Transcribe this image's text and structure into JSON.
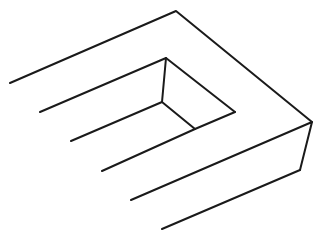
{
  "figure": {
    "title": "",
    "width": 333,
    "height": 243,
    "stroke_color": "#1a1a1a",
    "background": "#ffffff",
    "paths": [
      {
        "name": "outer-top-edge",
        "points": [
          [
            10,
            83
          ],
          [
            176,
            11
          ],
          [
            312,
            122
          ]
        ]
      },
      {
        "name": "prong-2-top",
        "points": [
          [
            40,
            112
          ],
          [
            166,
            58
          ],
          [
            235,
            112
          ]
        ]
      },
      {
        "name": "inner-vertical",
        "points": [
          [
            166,
            58
          ],
          [
            162,
            102
          ]
        ]
      },
      {
        "name": "prong-3",
        "points": [
          [
            71,
            141
          ],
          [
            162,
            102
          ],
          [
            195,
            129
          ]
        ]
      },
      {
        "name": "prong-4",
        "points": [
          [
            102,
            171
          ],
          [
            195,
            129
          ],
          [
            235,
            112
          ]
        ]
      },
      {
        "name": "prong-5",
        "points": [
          [
            131,
            200
          ],
          [
            312,
            122
          ],
          [
            300,
            170
          ]
        ]
      },
      {
        "name": "prong-6",
        "points": [
          [
            162,
            229
          ],
          [
            300,
            170
          ]
        ]
      }
    ]
  }
}
